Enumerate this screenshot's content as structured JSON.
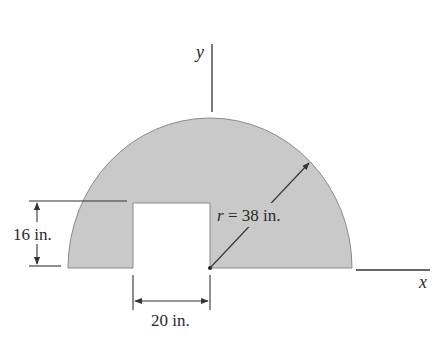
{
  "figure": {
    "type": "composite area (semicircle with rectangular cutout)",
    "colors": {
      "fill": "#c9c9c9",
      "outline": "#8a8a8a",
      "line": "#333333",
      "background": "#ffffff"
    },
    "axes": {
      "x_label": "x",
      "y_label": "y"
    },
    "dimensions": {
      "radius_label": "r = 38 in.",
      "height_label": "16 in.",
      "width_label": "20 in."
    }
  }
}
